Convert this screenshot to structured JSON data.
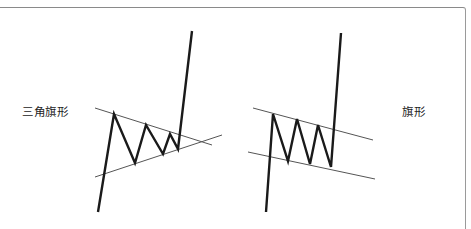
{
  "diagram": {
    "labels": {
      "triangle_flag": "三角旗形",
      "flag": "旗形"
    },
    "colors": {
      "price_line": "#1a1a1a",
      "trend_line": "#555555",
      "border": "#8a8a8a",
      "background": "#ffffff"
    },
    "patterns": [
      {
        "name": "triangle_flag",
        "label": "三角旗形",
        "price_path": [
          [
            98,
            212
          ],
          [
            114,
            114
          ],
          [
            135,
            163
          ],
          [
            146,
            125
          ],
          [
            163,
            154
          ],
          [
            170,
            134
          ],
          [
            178,
            149
          ],
          [
            192,
            31
          ]
        ],
        "upper_trendline": [
          [
            95,
            108
          ],
          [
            212,
            145
          ]
        ],
        "lower_trendline": [
          [
            95,
            177
          ],
          [
            222,
            135
          ]
        ]
      },
      {
        "name": "flag",
        "label": "旗形",
        "price_path": [
          [
            266,
            212
          ],
          [
            273,
            114
          ],
          [
            288,
            161
          ],
          [
            297,
            119
          ],
          [
            310,
            164
          ],
          [
            318,
            125
          ],
          [
            331,
            167
          ],
          [
            341,
            33
          ]
        ],
        "upper_trendline": [
          [
            253,
            108
          ],
          [
            373,
            140
          ]
        ],
        "lower_trendline": [
          [
            248,
            152
          ],
          [
            375,
            179
          ]
        ]
      }
    ]
  }
}
